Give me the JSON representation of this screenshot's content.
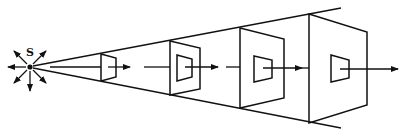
{
  "diagram": {
    "source": {
      "label": "S",
      "x": 30,
      "y": 67
    },
    "colors": {
      "ink": "#111111",
      "background": "#ffffff"
    },
    "beam": {
      "top_end": [
        341,
        8
      ],
      "bottom_end": [
        341,
        128
      ]
    },
    "frames": [
      {
        "left_x": 101,
        "left_top": 54,
        "left_bottom": 81,
        "right_x": 116,
        "right_top": 58,
        "right_bottom": 77,
        "inner": null
      },
      {
        "left_x": 170,
        "left_top": 41,
        "left_bottom": 95,
        "right_x": 200,
        "right_top": 48,
        "right_bottom": 89,
        "inner": {
          "left_x": 177,
          "left_top": 55,
          "left_bottom": 81,
          "right_x": 192,
          "right_top": 59,
          "right_bottom": 77
        }
      },
      {
        "left_x": 240,
        "left_top": 28,
        "left_bottom": 108,
        "right_x": 284,
        "right_top": 39,
        "right_bottom": 98,
        "inner": {
          "left_x": 254,
          "left_top": 56,
          "left_bottom": 82,
          "right_x": 272,
          "right_top": 60,
          "right_bottom": 78
        }
      },
      {
        "left_x": 309,
        "left_top": 14,
        "left_bottom": 123,
        "right_x": 367,
        "right_top": 32,
        "right_bottom": 105,
        "inner": {
          "left_x": 331,
          "left_top": 55,
          "left_bottom": 82,
          "right_x": 349,
          "right_top": 60,
          "right_bottom": 78
        }
      }
    ]
  }
}
